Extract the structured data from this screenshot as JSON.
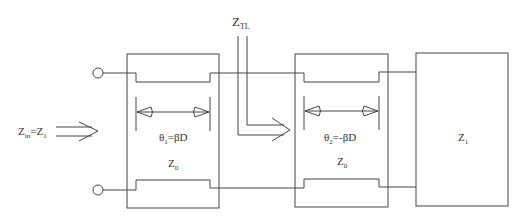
{
  "diagram": {
    "labels": {
      "z_tl_main": "Z",
      "z_tl_sub": "TL",
      "zin_main": "Z",
      "zin_sub": "in",
      "zin_eq": "=Z",
      "zin_eq_sub": "1",
      "theta1_main": "θ",
      "theta1_sub": "1",
      "theta1_eq": "=βD",
      "z0_left_main": "Z",
      "z0_left_sub": "0",
      "theta2_main": "θ",
      "theta2_sub": "2",
      "theta2_eq": "=-βD",
      "z0_right_main": "Z",
      "z0_right_sub": "0",
      "load_main": "Z",
      "load_sub": "1"
    },
    "colors": {
      "line": "#444444",
      "text": "#333333",
      "background": "#ffffff"
    }
  }
}
